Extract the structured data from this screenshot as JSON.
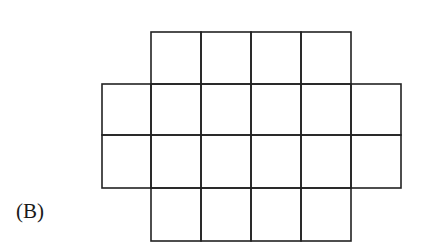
{
  "figure": {
    "label": "(B)",
    "stroke_color": "#222222",
    "grid": {
      "column_edges_x": [
        102,
        151,
        201,
        251,
        301,
        351,
        401
      ],
      "row_edges_y": [
        32,
        84,
        135,
        188,
        241
      ],
      "rows": [
        {
          "row": 1,
          "start_col": 1,
          "end_col": 5,
          "cell_count": 4
        },
        {
          "row": 2,
          "start_col": 0,
          "end_col": 6,
          "cell_count": 6
        },
        {
          "row": 3,
          "start_col": 0,
          "end_col": 6,
          "cell_count": 6
        },
        {
          "row": 4,
          "start_col": 1,
          "end_col": 5,
          "cell_count": 4
        }
      ],
      "total_cells": 20
    }
  }
}
